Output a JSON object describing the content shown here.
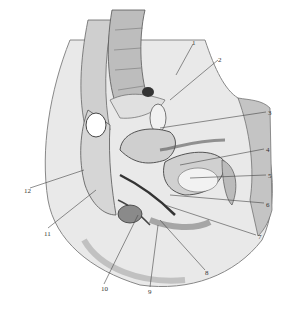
{
  "figure": {
    "labels": [
      {
        "id": "1",
        "text": "1",
        "x": 192,
        "y": 40
      },
      {
        "id": "2",
        "text": "2",
        "x": 218,
        "y": 57
      },
      {
        "id": "3",
        "text": "3",
        "x": 268,
        "y": 110
      },
      {
        "id": "4",
        "text": "4",
        "x": 266,
        "y": 147
      },
      {
        "id": "5",
        "text": "5",
        "x": 268,
        "y": 173
      },
      {
        "id": "6",
        "text": "6",
        "x": 266,
        "y": 202
      },
      {
        "id": "7",
        "text": "7",
        "x": 258,
        "y": 234
      },
      {
        "id": "8",
        "text": "8",
        "x": 205,
        "y": 270
      },
      {
        "id": "9",
        "text": "9",
        "x": 148,
        "y": 289
      },
      {
        "id": "10",
        "text": "10",
        "x": 101,
        "y": 286
      },
      {
        "id": "11",
        "text": "11",
        "x": 44,
        "y": 231
      },
      {
        "id": "12",
        "text": "12",
        "x": 24,
        "y": 188
      }
    ]
  }
}
